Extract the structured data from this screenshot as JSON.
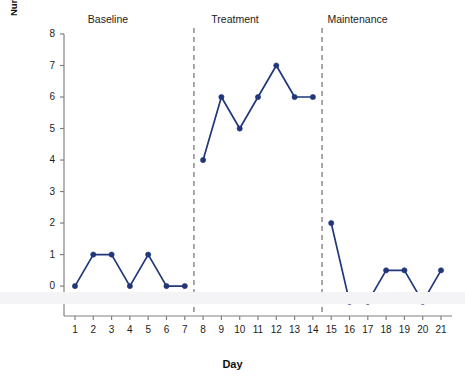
{
  "chart_data": {
    "type": "line",
    "title": "",
    "subtitle": "",
    "xlabel": "Day",
    "ylabel_line1": "Number of instances of self-control",
    "ylabel_line2": "exhibited on playground",
    "xlim": [
      0.4,
      21.6
    ],
    "ylim": [
      -0.95,
      8.0
    ],
    "ytick_labels": [
      "0",
      "1",
      "2",
      "3",
      "4",
      "5",
      "6",
      "7",
      "8"
    ],
    "ytick_values": [
      0,
      1,
      2,
      3,
      4,
      5,
      6,
      7,
      8
    ],
    "xtick_labels": [
      "1",
      "2",
      "3",
      "4",
      "5",
      "6",
      "7",
      "8",
      "9",
      "10",
      "11",
      "12",
      "13",
      "14",
      "15",
      "16",
      "17",
      "18",
      "19",
      "20",
      "21"
    ],
    "xtick_values": [
      1,
      2,
      3,
      4,
      5,
      6,
      7,
      8,
      9,
      10,
      11,
      12,
      13,
      14,
      15,
      16,
      17,
      18,
      19,
      20,
      21
    ],
    "grid": false,
    "legend_position": "none",
    "line_color": "#21377a",
    "marker_color": "#21377a",
    "axis_color": "#808080",
    "divider_color": "#7a7a7a",
    "x": [
      1,
      2,
      3,
      4,
      5,
      6,
      7,
      8,
      9,
      10,
      11,
      12,
      13,
      14,
      15,
      16,
      17,
      18,
      19,
      20,
      21
    ],
    "series": [
      {
        "name": "Instances of self-control",
        "values": [
          0,
          1,
          1,
          0,
          1,
          0,
          0,
          4,
          6,
          5,
          6,
          7,
          6,
          6,
          2,
          -0.5,
          -0.5,
          0.5,
          0.5,
          -0.5,
          0.5
        ],
        "segments": [
          {
            "phase": "Baseline",
            "x": [
              1,
              2,
              3,
              4,
              5,
              6,
              7
            ],
            "values": [
              0,
              1,
              1,
              0,
              1,
              0,
              0
            ]
          },
          {
            "phase": "Treatment",
            "x": [
              8,
              9,
              10,
              11,
              12,
              13,
              14
            ],
            "values": [
              4,
              6,
              5,
              6,
              7,
              6,
              6
            ]
          },
          {
            "phase": "Maintenance",
            "x": [
              15,
              16,
              17,
              18,
              19,
              20,
              21
            ],
            "values": [
              2,
              -0.5,
              -0.5,
              0.5,
              0.5,
              -0.5,
              0.5
            ]
          }
        ]
      }
    ],
    "phases": [
      {
        "label": "Baseline",
        "x_start": 1,
        "x_end": 7,
        "label_x": 4
      },
      {
        "label": "Treatment",
        "x_start": 8,
        "x_end": 14,
        "label_x": 11
      },
      {
        "label": "Maintenance",
        "x_start": 15,
        "x_end": 21,
        "label_x": 18
      }
    ],
    "phase_dividers": [
      7.5,
      14.5
    ],
    "annotations": []
  }
}
